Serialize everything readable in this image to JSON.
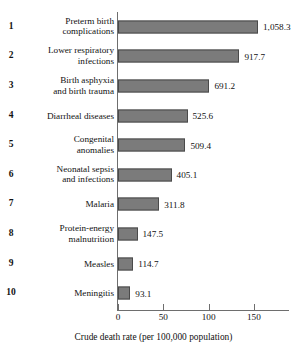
{
  "chart_data": {
    "type": "bar",
    "orientation": "horizontal",
    "title": "",
    "subtitle": "",
    "xlabel": "Crude death rate (per 100,000 population)",
    "ylabel": "",
    "grid": false,
    "legend": false,
    "xlim": [
      0,
      180
    ],
    "xticks": [
      0,
      50,
      100,
      150
    ],
    "xtick_labels": [
      "0",
      "50",
      "100",
      "150"
    ],
    "value_label_format": "comma-one-decimal",
    "bar_color": "#7b7b7b",
    "bar_edge_color": "#4a4a4a",
    "axis_color": "#6e6e6e",
    "categories": [
      "Preterm birth\ncomplications",
      "Lower respiratory\ninfections",
      "Birth asphyxia\nand birth trauma",
      "Diarrheal diseases",
      "Congenital\nanomalies",
      "Neonatal sepsis\nand infections",
      "Malaria",
      "Protein-energy\nmalnutrition",
      "Measles",
      "Meningitis"
    ],
    "values": [
      1058.3,
      917.7,
      691.2,
      525.6,
      509.4,
      405.1,
      311.8,
      147.5,
      114.7,
      93.1
    ],
    "value_labels": [
      "1,058.3",
      "917.7",
      "691.2",
      "525.6",
      "509.4",
      "405.1",
      "311.8",
      "147.5",
      "114.7",
      "93.1"
    ],
    "ranks": [
      "1",
      "2",
      "3",
      "4",
      "5",
      "6",
      "7",
      "8",
      "9",
      "10"
    ]
  },
  "rows": [
    {
      "rank": "1",
      "label": "Preterm birth\ncomplications",
      "value": 1058.3,
      "value_label": "1,058.3"
    },
    {
      "rank": "2",
      "label": "Lower respiratory\ninfections",
      "value": 917.7,
      "value_label": "917.7"
    },
    {
      "rank": "3",
      "label": "Birth asphyxia\nand birth trauma",
      "value": 691.2,
      "value_label": "691.2"
    },
    {
      "rank": "4",
      "label": "Diarrheal diseases",
      "value": 525.6,
      "value_label": "525.6"
    },
    {
      "rank": "5",
      "label": "Congenital\nanomalies",
      "value": 509.4,
      "value_label": "509.4"
    },
    {
      "rank": "6",
      "label": "Neonatal sepsis\nand infections",
      "value": 405.1,
      "value_label": "405.1"
    },
    {
      "rank": "7",
      "label": "Malaria",
      "value": 311.8,
      "value_label": "311.8"
    },
    {
      "rank": "8",
      "label": "Protein-energy\nmalnutrition",
      "value": 147.5,
      "value_label": "147.5"
    },
    {
      "rank": "9",
      "label": "Measles",
      "value": 114.7,
      "value_label": "114.7"
    },
    {
      "rank": "10",
      "label": "Meningitis",
      "value": 93.1,
      "value_label": "93.1"
    }
  ],
  "axis": {
    "x_title": "Crude death rate (per 100,000 population)",
    "ticks": [
      {
        "value": 0,
        "label": "0"
      },
      {
        "value": 50,
        "label": "50"
      },
      {
        "value": 100,
        "label": "100"
      },
      {
        "value": 150,
        "label": "150"
      }
    ]
  }
}
